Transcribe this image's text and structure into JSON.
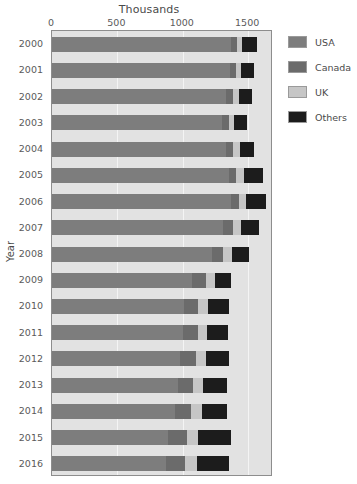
{
  "chart_data": {
    "type": "bar",
    "subtype": "stacked-horizontal-bar",
    "title": "Thousands",
    "xlabel": "Thousands",
    "ylabel": "Year",
    "orientation": "horizontal",
    "stacked": true,
    "grid": true,
    "legend_position": "right",
    "xlim": [
      0,
      1690
    ],
    "xticks": [
      0,
      500,
      1000,
      1500
    ],
    "xtick_labels": [
      "0",
      "500",
      "1000",
      "1500"
    ],
    "categories": [
      "2000",
      "2001",
      "2002",
      "2003",
      "2004",
      "2005",
      "2006",
      "2007",
      "2008",
      "2009",
      "2010",
      "2011",
      "2012",
      "2013",
      "2014",
      "2015",
      "2016"
    ],
    "series": [
      {
        "name": "USA",
        "color": "#7d7d7d",
        "values": [
          1370,
          1360,
          1330,
          1300,
          1330,
          1350,
          1370,
          1310,
          1220,
          1070,
          1010,
          1000,
          980,
          960,
          940,
          890,
          870
        ]
      },
      {
        "name": "Canada",
        "color": "#6b6b6b",
        "values": [
          45,
          45,
          55,
          50,
          55,
          60,
          60,
          75,
          90,
          105,
          110,
          115,
          120,
          120,
          125,
          145,
          150
        ]
      },
      {
        "name": "UK",
        "color": "#c6c6c6",
        "values": [
          40,
          40,
          45,
          45,
          50,
          55,
          55,
          60,
          65,
          70,
          75,
          70,
          75,
          75,
          80,
          85,
          90
        ]
      },
      {
        "name": "Others",
        "color": "#1c1c1c",
        "values": [
          110,
          100,
          100,
          100,
          110,
          145,
          150,
          135,
          135,
          125,
          155,
          160,
          175,
          180,
          190,
          250,
          245
        ]
      }
    ],
    "totals": [
      1565,
      1545,
      1530,
      1495,
      1545,
      1610,
      1635,
      1580,
      1510,
      1370,
      1350,
      1345,
      1350,
      1335,
      1335,
      1370,
      1355
    ]
  },
  "legend": {
    "items": [
      {
        "label": "USA",
        "color": "#7d7d7d"
      },
      {
        "label": "Canada",
        "color": "#6b6b6b"
      },
      {
        "label": "UK",
        "color": "#c6c6c6"
      },
      {
        "label": "Others",
        "color": "#1c1c1c"
      }
    ]
  },
  "colors": {
    "plot_background": "#e2e2e2",
    "plot_border": "#8d8d8d",
    "gridline": "#f4f4f4",
    "page_background": "#ffffff",
    "text": "#4a4a4a"
  }
}
